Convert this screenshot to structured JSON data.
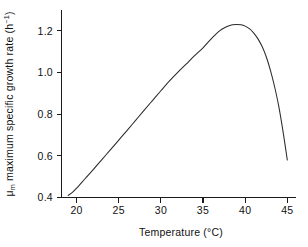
{
  "chart_data": {
    "type": "line",
    "title": "",
    "xlabel": "Temperature (°C)",
    "ylabel": "μm maximum specific growth rate (h⁻¹)",
    "ylabel_parts": {
      "symbol": "μ",
      "symbol_sub": "m",
      "text": " maximum specific growth rate (h",
      "exponent": "−1",
      "tail": ")"
    },
    "xlim": [
      18.2,
      46.0
    ],
    "ylim": [
      0.36,
      1.285
    ],
    "xticks": [
      20,
      25,
      30,
      35,
      40,
      45
    ],
    "xtick_labels": [
      "20",
      "25",
      "30",
      "35",
      "40",
      "45"
    ],
    "yticks": [
      0.4,
      0.6,
      0.8,
      1.0,
      1.2
    ],
    "ytick_labels": [
      "0.4",
      "0.6",
      "0.8",
      "1.0",
      "1.2"
    ],
    "grid": false,
    "legend": null,
    "spines": [
      "left",
      "bottom"
    ],
    "line_color": "#2a2a2a",
    "background_color": "#ffffff",
    "series": [
      {
        "name": "maximum specific growth rate",
        "x": [
          19.0,
          19.5,
          20.0,
          21.0,
          22.0,
          23.0,
          24.0,
          25.0,
          26.0,
          27.0,
          28.0,
          29.0,
          30.0,
          31.0,
          32.0,
          33.0,
          34.0,
          35.0,
          36.0,
          36.5,
          37.0,
          37.5,
          38.0,
          38.5,
          39.0,
          39.5,
          40.0,
          40.5,
          41.0,
          41.5,
          42.0,
          42.5,
          43.0,
          43.5,
          44.0,
          44.5,
          45.0
        ],
        "y": [
          0.41,
          0.425,
          0.445,
          0.49,
          0.535,
          0.582,
          0.628,
          0.675,
          0.722,
          0.77,
          0.818,
          0.865,
          0.912,
          0.958,
          1.0,
          1.04,
          1.08,
          1.118,
          1.162,
          1.182,
          1.2,
          1.213,
          1.222,
          1.228,
          1.23,
          1.228,
          1.222,
          1.21,
          1.19,
          1.162,
          1.125,
          1.075,
          1.01,
          0.93,
          0.835,
          0.715,
          0.58
        ]
      }
    ],
    "annotations": {
      "peak_temperature": 39.0,
      "peak_growth_rate": 1.23,
      "start_temperature": 19.0,
      "start_growth_rate": 0.41,
      "end_temperature": 45.0,
      "end_growth_rate": 0.58
    }
  }
}
